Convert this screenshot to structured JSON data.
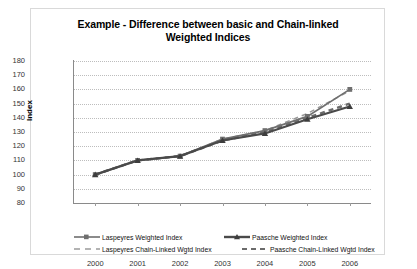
{
  "chart_data": {
    "type": "line",
    "title": "Example - Difference between basic and Chain-linked Weighted Indices",
    "title_line1": "Example - Difference between basic and Chain-linked",
    "title_line2": "Weighted Indices",
    "xlabel": "",
    "ylabel": "Index",
    "categories": [
      "2000",
      "2001",
      "2002",
      "2003",
      "2004",
      "2005",
      "2006"
    ],
    "x": [
      2000,
      2001,
      2002,
      2003,
      2004,
      2005,
      2006
    ],
    "ylim": [
      80,
      180
    ],
    "ytick_labels": [
      "180",
      "170",
      "160",
      "150",
      "140",
      "130",
      "120",
      "110",
      "100",
      "90",
      "80"
    ],
    "ytick_values": [
      180,
      170,
      160,
      150,
      140,
      130,
      120,
      110,
      100,
      90,
      80
    ],
    "grid": "horizontal-dotted",
    "legend_position": "bottom",
    "series": [
      {
        "name": "Laspeyres Weighted Index",
        "values": [
          100,
          110,
          113,
          125,
          131,
          141,
          160
        ],
        "style": "solid",
        "marker": "square",
        "color": "#6f6f6f"
      },
      {
        "name": "Paasche Weighted Index",
        "values": [
          100,
          110,
          113,
          124,
          129,
          139,
          148
        ],
        "style": "solid",
        "marker": "triangle",
        "color": "#4a4a4a"
      },
      {
        "name": "Laspeyres Chain-Linked Wgtd Index",
        "values": [
          100,
          110,
          113,
          125,
          131,
          143,
          159
        ],
        "style": "dashed",
        "marker": "none",
        "color": "#9a9a9a"
      },
      {
        "name": "Paasche Chain-Linked Wgtd Index",
        "values": [
          100,
          110,
          113,
          124,
          130,
          140,
          150
        ],
        "style": "dashed-thick",
        "marker": "none",
        "color": "#6b6b6b"
      }
    ]
  },
  "legend": {
    "items": [
      {
        "label": "Laspeyres Weighted Index"
      },
      {
        "label": "Paasche Weighted Index"
      },
      {
        "label": "Laspeyres Chain-Linked Wgtd Index"
      },
      {
        "label": "Paasche Chain-Linked Wgtd Index"
      }
    ]
  },
  "colors": {
    "gridline": "#bdbdbd",
    "axis": "#8a8a8a",
    "border": "#d9d9d9",
    "text": "#000000"
  }
}
